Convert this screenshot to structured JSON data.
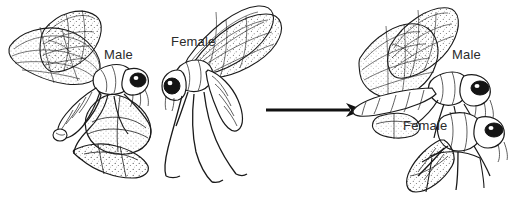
{
  "figure": {
    "background_color": "#ffffff",
    "ink_color": "#1a1a1a",
    "width": 509,
    "height": 198
  },
  "labels": {
    "male_left": "Male",
    "female_middle": "Female",
    "male_right": "Male",
    "female_right": "Female"
  },
  "arrow": {
    "name": "sequence-arrow",
    "direction": "right",
    "from_x": 268,
    "to_x": 360,
    "y": 110
  },
  "panels": [
    {
      "id": "male",
      "caption": "Male",
      "description": "Male hangingfly in flight holding a captured prey item with its hind legs"
    },
    {
      "id": "female",
      "caption": "Female",
      "description": "Female hangingfly hanging with long legs extended"
    },
    {
      "id": "pair",
      "caption": "Male and Female",
      "description": "Mating pair, male above transferring the nuptial prey gift to the female below"
    }
  ]
}
